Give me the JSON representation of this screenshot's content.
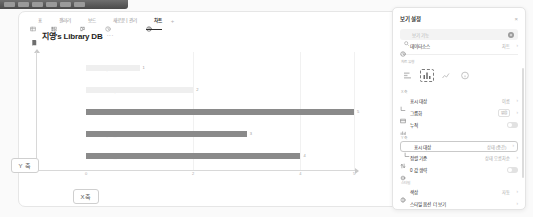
{
  "window": {
    "chip_count": 6
  },
  "viewbar": {
    "tabs": [
      {
        "label": "표",
        "icon": "table-icon",
        "active": false
      },
      {
        "label": "갤러리",
        "icon": "gallery-icon",
        "active": false
      },
      {
        "label": "보드",
        "icon": "board-icon",
        "active": false
      },
      {
        "label": "새로운 | 관리",
        "icon": "clock-icon",
        "active": false
      },
      {
        "label": "차트",
        "icon": "chart-icon",
        "active": true
      }
    ],
    "add_label": "+"
  },
  "page": {
    "title": "지영's Library DB",
    "title_icon": "book-icon",
    "more_label": "···"
  },
  "annotations": {
    "y_axis": "Y 축",
    "x_axis": "X축"
  },
  "chart_data": {
    "type": "bar",
    "orientation": "horizontal",
    "title": "지영's Library DB",
    "xlabel": "",
    "ylabel": "",
    "categories": [
      "사고 싶은",
      "읽기 전",
      "읽는 중",
      "읽다 말았음",
      "읽었음"
    ],
    "values": [
      1,
      2,
      5,
      3,
      4
    ],
    "value_labels": [
      "1",
      "2",
      "5",
      "3",
      "4"
    ],
    "xticks": [
      "0",
      "2",
      "4",
      "5"
    ],
    "xtick_values": [
      0,
      2,
      4,
      5
    ],
    "xlim": [
      0,
      5
    ],
    "grid": true,
    "legend": "none",
    "bar_colors": [
      "#efefef",
      "#efefef",
      "#8a8a8a",
      "#8a8a8a",
      "#8a8a8a"
    ]
  },
  "panel": {
    "title": "보기 설정",
    "close_label": "×",
    "search": {
      "placeholder": "보기 기능",
      "icon": "search-icon",
      "action_icon": "plus-circle-icon"
    },
    "rows_top": [
      {
        "icon": "clock-icon",
        "label": "데이터소스",
        "value": "차트",
        "chevron": "›"
      }
    ],
    "section_chart_type": "차트 유형",
    "chart_types": [
      {
        "name": "bar-chart-icon",
        "selected": false
      },
      {
        "name": "column-chart-icon",
        "selected": true
      },
      {
        "name": "line-chart-icon",
        "selected": false
      },
      {
        "name": "more-types-icon",
        "selected": false
      }
    ],
    "section_xaxis": "X축",
    "rows_x": [
      {
        "icon": "axis-x-icon",
        "label": "표시 대상",
        "value": "이름",
        "chevron": "›",
        "control": "value"
      },
      {
        "icon": "group-icon",
        "label": "그룹화",
        "value": "없음",
        "chevron": "›",
        "control": "pill"
      },
      {
        "icon": "stack-icon",
        "label": "누적",
        "value": "",
        "chevron": "",
        "control": "toggle"
      }
    ],
    "section_yaxis": "Y축",
    "rows_y": [
      {
        "icon": "axis-y-icon",
        "label": "표시 대상",
        "value": "상태 (중간)",
        "chevron": "›",
        "control": "value",
        "boxed": true
      },
      {
        "icon": "sort-icon",
        "label": "정렬 기준",
        "value": "상태 오름차순",
        "chevron": "›",
        "control": "value"
      },
      {
        "icon": "omit-icon",
        "label": "0 값 생략",
        "value": "",
        "chevron": "",
        "control": "toggle"
      }
    ],
    "section_style": "스타일",
    "rows_style": [
      {
        "icon": "color-icon",
        "label": "색상",
        "value": "자동",
        "chevron": "›",
        "control": "value"
      },
      {
        "icon": "options-icon",
        "label": "스타일 옵션 더 보기",
        "value": "",
        "chevron": "›",
        "control": "value"
      }
    ]
  }
}
